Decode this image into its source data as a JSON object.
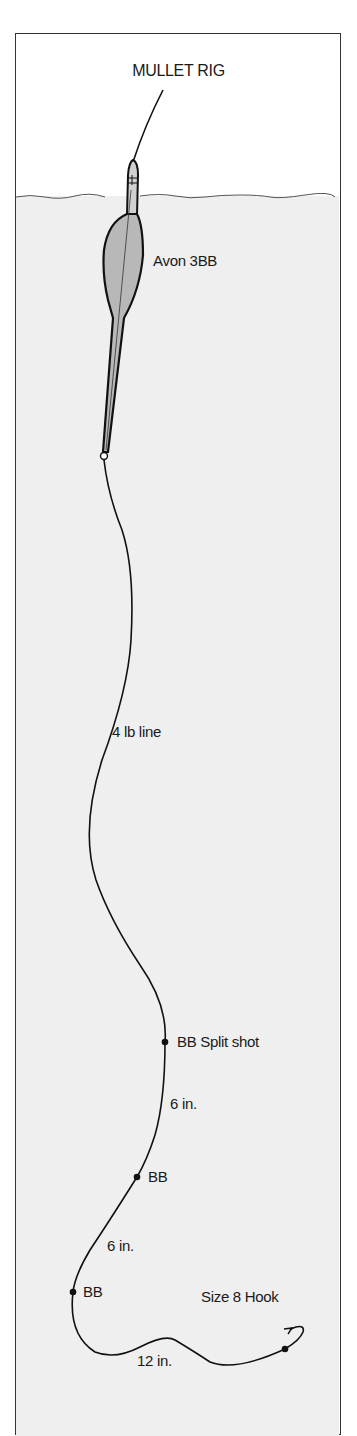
{
  "diagram": {
    "title": "MULLET RIG",
    "colors": {
      "background": "#ffffff",
      "water": "#efefef",
      "float_fill": "#b8b8b8",
      "line": "#111111",
      "frame": "#333333"
    },
    "labels": {
      "float": "Avon 3BB",
      "main_line": "4 lb line",
      "shot_1": "BB Split shot",
      "gap_1": "6 in.",
      "shot_2": "BB",
      "gap_2": "6 in.",
      "shot_3": "BB",
      "hook": "Size 8 Hook",
      "hook_length": "12 in."
    }
  }
}
